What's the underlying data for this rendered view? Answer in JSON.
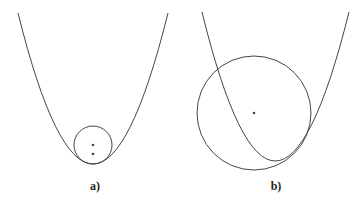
{
  "figures": [
    {
      "id": "a",
      "label": "a)",
      "description": "Small circle inscribed at the bottom of a parabola, tangent at vertex; two points marked inside"
    },
    {
      "id": "b",
      "label": "b)",
      "description": "Large circle intersecting a parabola, tangent on the right side; center point marked"
    }
  ],
  "colors": {
    "stroke": "#444444",
    "background": "#ffffff"
  }
}
